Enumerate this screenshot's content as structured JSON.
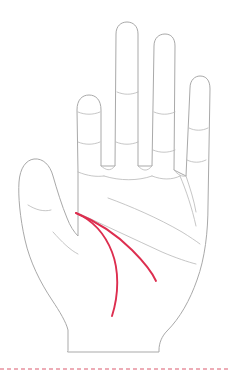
{
  "figure": {
    "background_color": "#ffffff"
  },
  "style": {
    "outline_color": "#a9a9a9",
    "crease_color": "#b8b8b8",
    "highlight_color": "#dd2e4f",
    "divider_color": "#e8919f",
    "outline_width": "1",
    "crease_width": "0.8",
    "highlight_width": "1.9"
  },
  "hand": {
    "outline_name": "hand-outline",
    "digits": [
      {
        "name": "thumb",
        "label": "Thumb",
        "creases": 1
      },
      {
        "name": "index-finger",
        "label": "Index finger",
        "creases": 2
      },
      {
        "name": "middle-finger",
        "label": "Middle finger",
        "creases": 2
      },
      {
        "name": "ring-finger",
        "label": "Ring finger",
        "creases": 2
      },
      {
        "name": "little-finger",
        "label": "Little finger",
        "creases": 2
      }
    ],
    "palm_lines": [
      {
        "name": "heart-line",
        "label": "Heart line",
        "highlighted": false,
        "color": "#b8b8b8"
      },
      {
        "name": "head-line",
        "label": "Head line",
        "highlighted": false,
        "color": "#b8b8b8"
      },
      {
        "name": "life-line",
        "label": "Life line",
        "highlighted": true,
        "color": "#dd2e4f"
      },
      {
        "name": "branch-line",
        "label": "Branch line",
        "highlighted": true,
        "color": "#dd2e4f"
      }
    ]
  },
  "divider": {
    "name": "dashed-divider",
    "style": "dashed",
    "color": "#e8919f",
    "y": 369
  }
}
